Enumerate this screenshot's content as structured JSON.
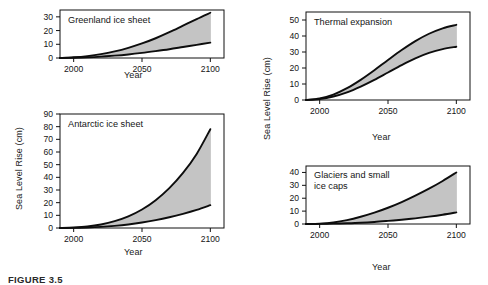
{
  "figure": {
    "caption": "FIGURE 3.5",
    "axis_x_label": "Year",
    "axis_y_label": "Sea Level Rise (cm)"
  },
  "chart_data": [
    {
      "type": "area",
      "title": "Greenland ice sheet",
      "xlabel": "Year",
      "ylabel": "Sea Level Rise (cm)",
      "xlim": [
        1990,
        2110
      ],
      "ylim": [
        0,
        35
      ],
      "xticks": [
        2000,
        2050,
        2100
      ],
      "yticks": [
        0,
        10,
        20,
        30
      ],
      "x": [
        1990,
        2000,
        2010,
        2020,
        2030,
        2040,
        2050,
        2060,
        2070,
        2080,
        2090,
        2100
      ],
      "series": [
        {
          "name": "upper bound",
          "values": [
            0,
            0.5,
            1.4,
            2.8,
            4.8,
            7.4,
            10.6,
            14.4,
            18.8,
            23.6,
            28.4,
            33.0
          ]
        },
        {
          "name": "lower bound",
          "values": [
            0,
            0.2,
            0.5,
            1.0,
            1.7,
            2.6,
            3.7,
            5.0,
            6.4,
            8.0,
            9.6,
            11.2
          ]
        }
      ],
      "grid": false,
      "legend": "none",
      "band_fill": "#c4c4c4"
    },
    {
      "type": "area",
      "title": "Antarctic ice sheet",
      "xlabel": "Year",
      "ylabel": "Sea Level Rise (cm)",
      "xlim": [
        1990,
        2110
      ],
      "ylim": [
        0,
        90
      ],
      "xticks": [
        2000,
        2050,
        2100
      ],
      "yticks": [
        0,
        10,
        20,
        30,
        40,
        50,
        60,
        70,
        80,
        90
      ],
      "x": [
        1990,
        2000,
        2010,
        2020,
        2030,
        2040,
        2050,
        2060,
        2070,
        2080,
        2090,
        2100
      ],
      "series": [
        {
          "name": "upper bound",
          "values": [
            0,
            0.4,
            1.2,
            2.8,
            5.4,
            9.2,
            14.6,
            22.0,
            31.5,
            43.5,
            58.5,
            78.0
          ]
        },
        {
          "name": "lower bound",
          "values": [
            0,
            0.1,
            0.4,
            0.9,
            1.7,
            2.8,
            4.3,
            6.2,
            8.5,
            11.2,
            14.3,
            18.0
          ]
        }
      ],
      "grid": false,
      "legend": "none",
      "band_fill": "#c4c4c4"
    },
    {
      "type": "area",
      "title": "Thermal expansion",
      "xlabel": "Year",
      "ylabel": "Sea Level Rise (cm)",
      "xlim": [
        1990,
        2110
      ],
      "ylim": [
        0,
        55
      ],
      "xticks": [
        2000,
        2050,
        2100
      ],
      "yticks": [
        0,
        10,
        20,
        30,
        40,
        50
      ],
      "x": [
        1990,
        2000,
        2010,
        2020,
        2030,
        2040,
        2050,
        2060,
        2070,
        2080,
        2090,
        2100
      ],
      "series": [
        {
          "name": "upper bound",
          "values": [
            0,
            1.0,
            3.4,
            7.4,
            12.6,
            18.6,
            25.0,
            31.2,
            36.8,
            41.4,
            44.8,
            47.0
          ]
        },
        {
          "name": "lower bound",
          "values": [
            0,
            0.6,
            2.2,
            4.8,
            8.4,
            12.6,
            17.2,
            21.8,
            26.0,
            29.4,
            31.8,
            33.3
          ]
        }
      ],
      "grid": false,
      "legend": "none",
      "band_fill": "#c4c4c4"
    },
    {
      "type": "area",
      "title": "Glaciers and small ice caps",
      "xlabel": "Year",
      "ylabel": "Sea Level Rise (cm)",
      "xlim": [
        1990,
        2110
      ],
      "ylim": [
        0,
        45
      ],
      "xticks": [
        2000,
        2050,
        2100
      ],
      "yticks": [
        0,
        10,
        20,
        30,
        40
      ],
      "x": [
        1990,
        2000,
        2010,
        2020,
        2030,
        2040,
        2050,
        2060,
        2070,
        2080,
        2090,
        2100
      ],
      "series": [
        {
          "name": "upper bound",
          "values": [
            0,
            0.3,
            1.2,
            3.0,
            5.6,
            8.8,
            12.6,
            17.0,
            22.0,
            27.4,
            33.4,
            40.0
          ]
        },
        {
          "name": "lower bound",
          "values": [
            0,
            0.1,
            0.3,
            0.6,
            1.0,
            1.6,
            2.4,
            3.3,
            4.4,
            5.7,
            7.2,
            9.0
          ]
        }
      ],
      "grid": false,
      "legend": "none",
      "band_fill": "#c4c4c4"
    }
  ]
}
